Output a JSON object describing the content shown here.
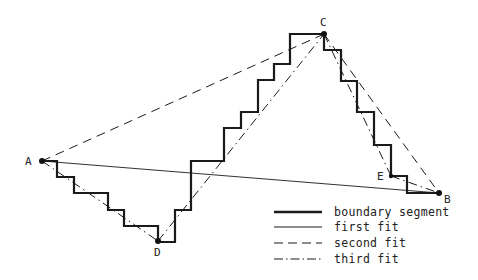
{
  "figure": {
    "type": "polygon-approximation-diagram",
    "width": 478,
    "height": 280,
    "points": {
      "A": {
        "label": "A",
        "x": 42,
        "y": 161
      },
      "B": {
        "label": "B",
        "x": 439,
        "y": 193
      },
      "C": {
        "label": "C",
        "x": 324,
        "y": 34
      },
      "D": {
        "label": "D",
        "x": 158,
        "y": 241
      },
      "E": {
        "label": "E",
        "x": 391,
        "y": 176
      }
    },
    "boundary_segment": [
      [
        42,
        161
      ],
      [
        57,
        161
      ],
      [
        57,
        177
      ],
      [
        74,
        177
      ],
      [
        74,
        193
      ],
      [
        108,
        193
      ],
      [
        108,
        210
      ],
      [
        124,
        210
      ],
      [
        124,
        226
      ],
      [
        158,
        226
      ],
      [
        158,
        242
      ],
      [
        175,
        242
      ],
      [
        175,
        210
      ],
      [
        191,
        210
      ],
      [
        191,
        161
      ],
      [
        224,
        161
      ],
      [
        224,
        128
      ],
      [
        241,
        128
      ],
      [
        241,
        112
      ],
      [
        258,
        112
      ],
      [
        258,
        80
      ],
      [
        274,
        80
      ],
      [
        274,
        64
      ],
      [
        290,
        64
      ],
      [
        290,
        34
      ],
      [
        324,
        34
      ],
      [
        324,
        50
      ],
      [
        341,
        50
      ],
      [
        341,
        81
      ],
      [
        357,
        81
      ],
      [
        357,
        112
      ],
      [
        374,
        112
      ],
      [
        374,
        145
      ],
      [
        391,
        145
      ],
      [
        391,
        176
      ],
      [
        407,
        176
      ],
      [
        407,
        193
      ],
      [
        439,
        193
      ]
    ],
    "first_fit": [
      [
        "A",
        "B"
      ]
    ],
    "second_fit": [
      [
        "A",
        "C"
      ],
      [
        "C",
        "B"
      ]
    ],
    "third_fit": [
      [
        "A",
        "D"
      ],
      [
        "D",
        "C"
      ],
      [
        "C",
        "E"
      ],
      [
        "E",
        "B"
      ]
    ],
    "colors": {
      "line": "#1a1a1a",
      "background": "#ffffff"
    }
  },
  "legend": {
    "items": [
      {
        "label": "boundary segment",
        "style": "thick"
      },
      {
        "label": "first fit",
        "style": "solid"
      },
      {
        "label": "second fit",
        "style": "dashed"
      },
      {
        "label": "third fit",
        "style": "dash-dot"
      }
    ]
  }
}
